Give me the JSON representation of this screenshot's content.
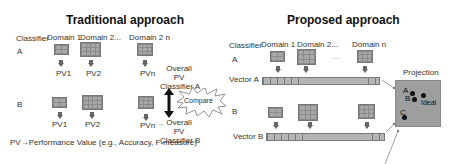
{
  "traditional": {
    "title": "Traditional approach",
    "classifier_label": "Classifier",
    "domains": [
      "Domain 1",
      "Domain 2...",
      "Domain 2 n"
    ],
    "row_a": {
      "label": "A",
      "pvs": [
        "PV1",
        "PV2",
        "PVn"
      ]
    },
    "row_b": {
      "label": "B",
      "pvs": [
        "PV1",
        "PV2",
        "PVn"
      ]
    },
    "overall_a": [
      "Overall",
      "PV",
      "Classifier A"
    ],
    "overall_b": [
      "Overall",
      "PV",
      "Classifier B"
    ],
    "arrow_b": "→",
    "compare_label": "Compare",
    "footnote": "PV→Performance Value (e.g., Accuracy, F-measure)"
  },
  "proposed": {
    "title": "Proposed approach",
    "classifier_label": "Classifier",
    "domains": [
      "Domain 1",
      "Domain 2...",
      "Domain n"
    ],
    "ellipsis": "......",
    "row_a": {
      "label": "A",
      "vector_label": "Vector A"
    },
    "row_b": {
      "label": "B",
      "vector_label": "Vector B"
    },
    "projection": {
      "title": "Projection",
      "points": [
        {
          "label": "A",
          "x": 24,
          "y": 17
        },
        {
          "label": "B",
          "x": 27,
          "y": 25
        },
        {
          "label": "Ideal",
          "x": 43,
          "y": 20
        },
        {
          "label": "C",
          "x": 13,
          "y": 44
        }
      ]
    }
  }
}
